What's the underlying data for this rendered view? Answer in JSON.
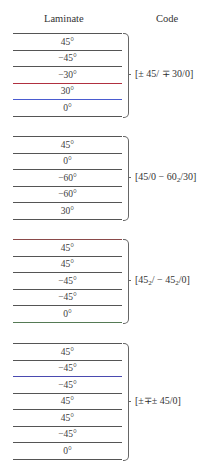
{
  "headers": {
    "laminate": "Laminate",
    "code": "Code"
  },
  "groups": [
    {
      "top": 33,
      "plies": [
        "45°",
        "−45°",
        "−30°",
        "30°",
        "0°"
      ],
      "line_colors": [
        "#555555",
        "#555555",
        "#555555",
        "#b03040",
        "#4a5bd0",
        "#555555"
      ],
      "code": "[± 45/ ∓ 30/0]"
    },
    {
      "top": 136,
      "plies": [
        "45°",
        "0°",
        "−60°",
        "−60°",
        "30°"
      ],
      "line_colors": [
        "#555555",
        "#555555",
        "#555555",
        "#555555",
        "#555555",
        "#555555"
      ],
      "code_parts": [
        "[45/0 − 60",
        "2",
        "/30]"
      ],
      "code": "[45/0 − 60₂/30]"
    },
    {
      "top": 239,
      "plies": [
        "45°",
        "45°",
        "−45°",
        "−45°",
        "0°"
      ],
      "line_colors": [
        "#8a4a4a",
        "#555555",
        "#555555",
        "#555555",
        "#555555",
        "#557a55"
      ],
      "code_parts": [
        "[45",
        "2",
        "/ − 45",
        "2",
        "/0]"
      ],
      "code": "[45₂/ − 45₂/0]"
    },
    {
      "top": 343,
      "plies": [
        "45°",
        "−45°",
        "−45°",
        "45°",
        "45°",
        "−45°",
        "0°"
      ],
      "line_colors": [
        "#555555",
        "#555555",
        "#4a4ab0",
        "#555555",
        "#555555",
        "#555555",
        "#555555",
        "#555555"
      ],
      "code": "[±∓± 45/0]"
    }
  ]
}
